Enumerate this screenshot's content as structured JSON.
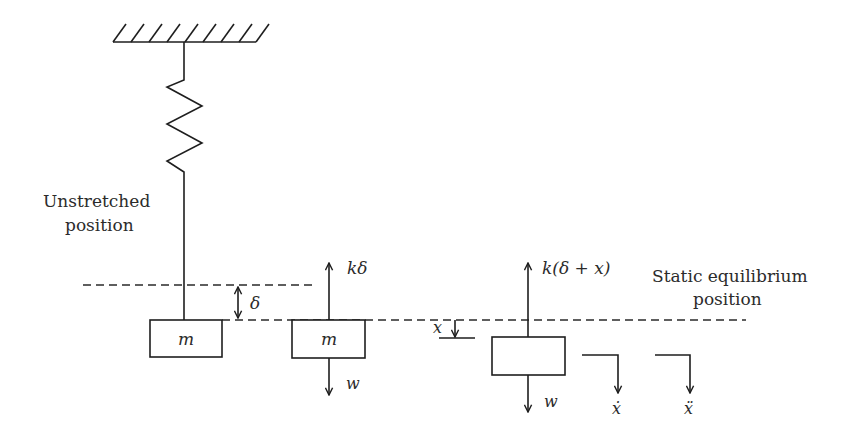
{
  "diagram": {
    "type": "spring-mass free body diagram",
    "labels": {
      "unstretched_line1": "Unstretched",
      "unstretched_line2": "position",
      "static_line1": "Static equilibrium",
      "static_line2": "position",
      "mass1": "m",
      "mass2": "m",
      "delta": "δ",
      "spring_force_static": "kδ",
      "weight2": "w",
      "displacement": "x",
      "spring_force_dynamic": "k(δ + x)",
      "weight3": "w",
      "velocity": "ẋ",
      "acceleration": "ẍ"
    },
    "colors": {
      "line": "#1e1e1e",
      "text": "#2b2b2b",
      "background": "#ffffff"
    }
  }
}
